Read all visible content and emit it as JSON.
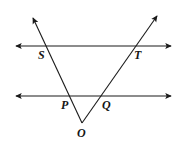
{
  "figure": {
    "kind": "geometry-diagram",
    "background_color": "#ffffff",
    "stroke_color": "#1a1a1a",
    "stroke_width": 1.1,
    "canvas": {
      "width": 181,
      "height": 147
    }
  },
  "labels": {
    "S": "S",
    "T": "T",
    "P": "P",
    "Q": "Q",
    "O": "O"
  },
  "points": {
    "S": {
      "x": 48,
      "y": 46,
      "label_x": 38,
      "label_y": 49
    },
    "T": {
      "x": 130,
      "y": 46,
      "label_x": 134,
      "label_y": 49
    },
    "P": {
      "x": 71,
      "y": 96,
      "label_x": 61,
      "label_y": 99
    },
    "Q": {
      "x": 98,
      "y": 96,
      "label_x": 102,
      "label_y": 99
    },
    "O": {
      "x": 82,
      "y": 123,
      "label_x": 77,
      "label_y": 127
    }
  },
  "lines": [
    {
      "name": "upper-parallel-line",
      "type": "double-arrow-line",
      "x1": 16,
      "y1": 46,
      "x2": 171,
      "y2": 46
    },
    {
      "name": "lower-parallel-line",
      "type": "double-arrow-line",
      "x1": 16,
      "y1": 96,
      "x2": 171,
      "y2": 96
    },
    {
      "name": "ray-o-through-p-s",
      "type": "single-arrow-ray",
      "x1": 82,
      "y1": 123,
      "x2": 33,
      "y2": 18
    },
    {
      "name": "ray-o-through-q-t",
      "type": "single-arrow-ray",
      "x1": 82,
      "y1": 123,
      "x2": 157,
      "y2": 16
    }
  ]
}
